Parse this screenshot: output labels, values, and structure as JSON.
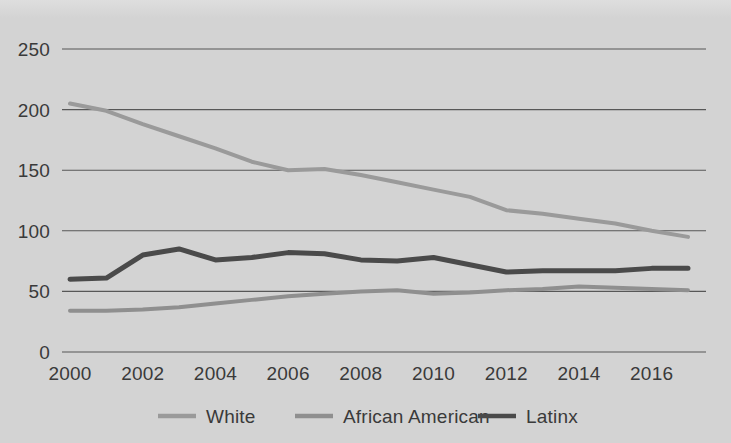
{
  "chart_data": {
    "type": "line",
    "title": "",
    "subtitle": "",
    "xlabel": "",
    "ylabel": "",
    "x": [
      2000,
      2001,
      2002,
      2003,
      2004,
      2005,
      2006,
      2007,
      2008,
      2009,
      2010,
      2011,
      2012,
      2013,
      2014,
      2015,
      2016,
      2017
    ],
    "xtick_labels": [
      "2000",
      "2002",
      "2004",
      "2006",
      "2008",
      "2010",
      "2012",
      "2014",
      "2016"
    ],
    "xtick_values": [
      2000,
      2002,
      2004,
      2006,
      2008,
      2010,
      2012,
      2014,
      2016
    ],
    "ytick_labels": [
      "0",
      "50",
      "100",
      "150",
      "200",
      "250"
    ],
    "ytick_values": [
      0,
      50,
      100,
      150,
      200,
      250
    ],
    "xlim": [
      2000,
      2017
    ],
    "ylim": [
      0,
      250
    ],
    "grid": "horizontal",
    "legend_position": "bottom",
    "series": [
      {
        "name": "White",
        "color": "#9a9a9a",
        "values": [
          205,
          199,
          188,
          178,
          168,
          157,
          150,
          151,
          146,
          140,
          134,
          128,
          117,
          114,
          110,
          106,
          100,
          95
        ]
      },
      {
        "name": "African American",
        "color": "#8f8f8f",
        "values": [
          34,
          34,
          35,
          37,
          40,
          43,
          46,
          48,
          50,
          51,
          48,
          49,
          51,
          52,
          54,
          53,
          52,
          51
        ]
      },
      {
        "name": "Latinx",
        "color": "#4a4a4a",
        "values": [
          60,
          61,
          80,
          85,
          76,
          78,
          82,
          81,
          76,
          75,
          78,
          72,
          66,
          67,
          67,
          67,
          69,
          69
        ]
      }
    ]
  },
  "colors": {
    "background": "#d3d3d3",
    "gridline": "#575757",
    "text": "#3a3a3a",
    "series_white": "#9a9a9a",
    "series_african_american": "#8f8f8f",
    "series_latinx": "#4a4a4a"
  }
}
